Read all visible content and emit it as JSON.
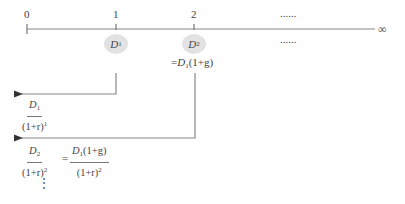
{
  "timeline": {
    "ticks": [
      {
        "label": "0",
        "x": 27
      },
      {
        "label": "1",
        "x": 116
      },
      {
        "label": "2",
        "x": 194
      }
    ],
    "ellipsis_top": "......",
    "ellipsis_bottom": "......",
    "infinity": "∞"
  },
  "cash_flows": {
    "d1": {
      "base": "D",
      "sub": "1"
    },
    "d2": {
      "base": "D",
      "sub": "2"
    },
    "d2_equivalent": {
      "prefix": "=",
      "base": "D",
      "sub": "1",
      "rest": "(1+g)"
    }
  },
  "present_values": {
    "pv1": {
      "num_base": "D",
      "num_sub": "1",
      "den": "(1+r)",
      "den_exp": "1"
    },
    "pv2": {
      "num_base": "D",
      "num_sub": "2",
      "den": "(1+r)",
      "den_exp": "2",
      "eq": "=",
      "num2_base": "D",
      "num2_sub": "1",
      "num2_rest": "(1+g)",
      "den2": "(1+r)",
      "den2_exp": "2"
    },
    "continuation": "⋮"
  }
}
